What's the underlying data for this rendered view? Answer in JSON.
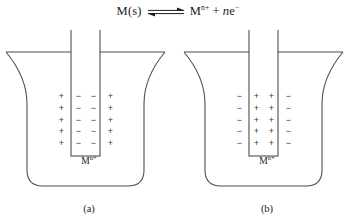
{
  "figure": {
    "equation": {
      "reactant": "M(s)",
      "arrow_icon": "equilibrium-arrow",
      "product_symbol": "M",
      "product_charge": "n+",
      "plus": "+",
      "electron_coefficient": "n",
      "electron_symbol": "e",
      "electron_charge": "−"
    },
    "panels": [
      {
        "caption": "(a)",
        "solution_symbol": "M",
        "solution_charge": "n+",
        "electrode_charge_sign": "−",
        "solution_charge_sign": "+",
        "charge_rows": 5,
        "outer_columns": 2,
        "inner_columns": 2,
        "outer_signs": [
          "+",
          "+",
          "+",
          "+",
          "+"
        ],
        "inner_signs": [
          "−",
          "−",
          "−",
          "−",
          "−"
        ]
      },
      {
        "caption": "(b)",
        "solution_symbol": "M",
        "solution_charge": "n+",
        "electrode_charge_sign": "+",
        "solution_charge_sign": "−",
        "charge_rows": 5,
        "outer_columns": 2,
        "inner_columns": 2,
        "outer_signs": [
          "−",
          "−",
          "−",
          "−",
          "−"
        ],
        "inner_signs": [
          "+",
          "+",
          "+",
          "+",
          "+"
        ]
      }
    ],
    "colors": {
      "stroke": "#4d4d4d",
      "text": "#1a1a1a",
      "background": "#ffffff"
    }
  }
}
